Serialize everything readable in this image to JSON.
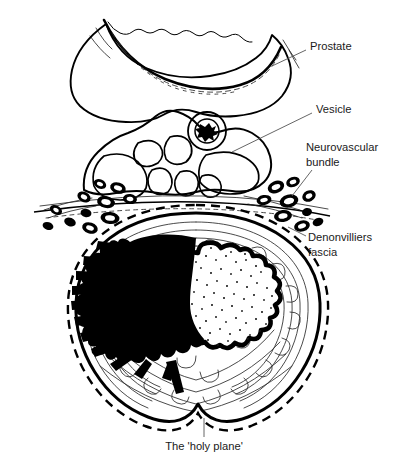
{
  "figure": {
    "background_color": "#ffffff",
    "ink_color": "#000000",
    "label_color": "#1a1a1a",
    "leader_color": "#555555",
    "width": 396,
    "height": 459
  },
  "annotations": [
    {
      "id": "prostate",
      "label": "Prostate",
      "text_x": 310,
      "text_y": 47,
      "anchor": "start",
      "leader": "M 306 50 L 272 66"
    },
    {
      "id": "vesicle",
      "label": "Vesicle",
      "text_x": 316,
      "text_y": 110,
      "anchor": "start",
      "leader": "M 312 113 L 232 152"
    },
    {
      "id": "neurovascular-bundle",
      "label": "Neurovascular",
      "label_line2": "bundle",
      "text_x": 306,
      "text_y": 148,
      "text_y2": 163,
      "anchor": "start",
      "leader": "M 312 170 L 292 196"
    },
    {
      "id": "denonvilliers-fascia",
      "label": "Denonvilliers",
      "label_line2": "fascia",
      "text_x": 308,
      "text_y": 238,
      "text_y2": 253,
      "anchor": "start",
      "leader": "M 306 236 L 288 227"
    },
    {
      "id": "holy-plane",
      "label": "The 'holy plane'",
      "text_x": 204,
      "text_y": 447,
      "anchor": "middle",
      "leader": "M 204 437 L 204 418"
    }
  ],
  "structures": [
    {
      "id": "prostate-gland",
      "name": "Prostate gland",
      "kind": "outline"
    },
    {
      "id": "seminal-vesicles",
      "name": "Seminal vesicle lobules",
      "kind": "outline-cluster"
    },
    {
      "id": "neurovascular-left",
      "name": "Left neurovascular bundle",
      "kind": "vessel-cluster"
    },
    {
      "id": "neurovascular-right",
      "name": "Right neurovascular bundle",
      "kind": "vessel-cluster"
    },
    {
      "id": "denonvilliers",
      "name": "Denonvilliers fascia",
      "kind": "fascial-line"
    },
    {
      "id": "mesorectum",
      "name": "Mesorectal fat",
      "kind": "fat-texture"
    },
    {
      "id": "mesorectal-fascia",
      "name": "Mesorectal fascia",
      "kind": "solid-line"
    },
    {
      "id": "holy-plane-line",
      "name": "Total mesorectal excision plane",
      "kind": "dashed-line"
    },
    {
      "id": "rectal-lumen",
      "name": "Rectal lumen with mucosal folds",
      "kind": "stipple"
    },
    {
      "id": "tumour",
      "name": "Tumour mass invading mesorectum",
      "kind": "solid-black"
    }
  ]
}
